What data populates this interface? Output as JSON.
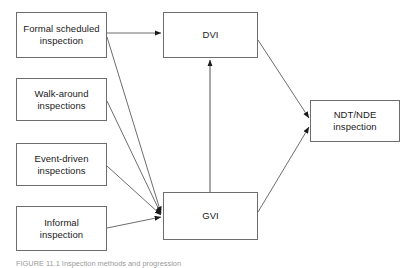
{
  "figure": {
    "type": "flow-diagram",
    "caption_prefix": "FIGURE 11.1",
    "caption_text": "FIGURE 11.1  Inspection methods and progression",
    "background_color": "#ffffff",
    "line_color": "#6d6d6d",
    "text_color": "#1a1a1a"
  },
  "nodes": {
    "formal_scheduled": {
      "id": "formal-scheduled-inspection",
      "label": "Formal scheduled\ninspection",
      "x": 16,
      "y": 12,
      "w": 91,
      "h": 46
    },
    "walk_around": {
      "id": "walk-around-inspections",
      "label": "Walk-around\ninspections",
      "x": 16,
      "y": 78,
      "w": 91,
      "h": 43
    },
    "event_driven": {
      "id": "event-driven-inspections",
      "label": "Event-driven\ninspections",
      "x": 16,
      "y": 143,
      "w": 91,
      "h": 43
    },
    "informal": {
      "id": "informal-inspection",
      "label": "Informal\ninspection",
      "x": 16,
      "y": 206,
      "w": 91,
      "h": 45
    },
    "dvi": {
      "id": "dvi",
      "label": "DVI",
      "x": 163,
      "y": 12,
      "w": 95,
      "h": 46
    },
    "gvi": {
      "id": "gvi",
      "label": "GVI",
      "x": 163,
      "y": 192,
      "w": 95,
      "h": 48
    },
    "ndt_nde": {
      "id": "ndt-nde-inspection",
      "label": "NDT/NDE\ninspection",
      "x": 310,
      "y": 100,
      "w": 90,
      "h": 42
    }
  },
  "edges": [
    {
      "id": "formal-to-dvi",
      "from": "formal_scheduled",
      "to": "dvi"
    },
    {
      "id": "formal-to-gvi",
      "from": "formal_scheduled",
      "to": "gvi"
    },
    {
      "id": "walk-around-to-gvi",
      "from": "walk_around",
      "to": "gvi"
    },
    {
      "id": "event-driven-to-gvi",
      "from": "event_driven",
      "to": "gvi"
    },
    {
      "id": "informal-to-gvi",
      "from": "informal",
      "to": "gvi"
    },
    {
      "id": "gvi-to-dvi",
      "from": "gvi",
      "to": "dvi"
    },
    {
      "id": "dvi-to-ndt",
      "from": "dvi",
      "to": "ndt_nde"
    },
    {
      "id": "gvi-to-ndt",
      "from": "gvi",
      "to": "ndt_nde"
    }
  ]
}
